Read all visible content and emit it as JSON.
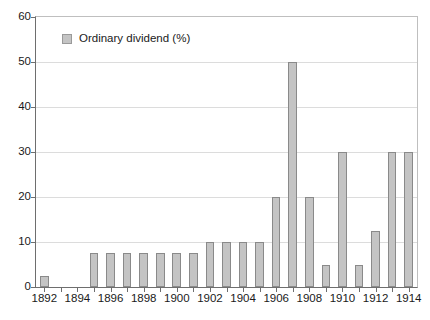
{
  "chart_data": {
    "type": "bar",
    "title": "",
    "subtitle": "",
    "xlabel": "",
    "ylabel": "",
    "ylim": [
      0,
      60
    ],
    "yticks": [
      0,
      10,
      20,
      30,
      40,
      50,
      60
    ],
    "xticks": [
      1892,
      1894,
      1896,
      1898,
      1900,
      1902,
      1904,
      1906,
      1908,
      1910,
      1912,
      1914
    ],
    "grid": true,
    "legend_position": "top-left",
    "legend": [
      "Ordinary dividend (%)"
    ],
    "series_name": "Ordinary dividend (%)",
    "bar_color": "#c4c4c4",
    "bar_border_color": "#8a8a8a",
    "categories": [
      1892,
      1893,
      1894,
      1895,
      1896,
      1897,
      1898,
      1899,
      1900,
      1901,
      1902,
      1903,
      1904,
      1905,
      1906,
      1907,
      1908,
      1909,
      1910,
      1911,
      1912,
      1913,
      1914
    ],
    "values": [
      2.5,
      0,
      0,
      7.5,
      7.5,
      7.5,
      7.5,
      7.5,
      7.5,
      7.5,
      10,
      10,
      10,
      10,
      20,
      50,
      20,
      5,
      30,
      5,
      12.5,
      30,
      30
    ]
  },
  "legend": {
    "label": "Ordinary dividend (%)",
    "swatch_icon": "legend-swatch-icon"
  },
  "axes": {
    "y_labels": [
      "0",
      "10",
      "20",
      "30",
      "40",
      "50",
      "60"
    ],
    "x_labels": [
      "1892",
      "1894",
      "1896",
      "1898",
      "1900",
      "1902",
      "1904",
      "1906",
      "1908",
      "1910",
      "1912",
      "1914"
    ]
  }
}
